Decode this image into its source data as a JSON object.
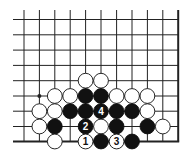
{
  "diagram": {
    "type": "go-board-fragment",
    "columns": 11,
    "rows": 9,
    "edges": [
      "right",
      "bottom"
    ],
    "colors": {
      "line": "#222222",
      "black_stone": "#111111",
      "white_stone": "#ffffff",
      "background": "#ffffff"
    },
    "star_points": [
      {
        "col": 1,
        "row": 5
      }
    ],
    "stones": [
      {
        "col": 4,
        "row": 4,
        "color": "white"
      },
      {
        "col": 5,
        "row": 4,
        "color": "white"
      },
      {
        "col": 2,
        "row": 5,
        "color": "white"
      },
      {
        "col": 3,
        "row": 5,
        "color": "white"
      },
      {
        "col": 4,
        "row": 5,
        "color": "black"
      },
      {
        "col": 5,
        "row": 5,
        "color": "black"
      },
      {
        "col": 6,
        "row": 5,
        "color": "white"
      },
      {
        "col": 7,
        "row": 5,
        "color": "white"
      },
      {
        "col": 8,
        "row": 5,
        "color": "white"
      },
      {
        "col": 1,
        "row": 6,
        "color": "white"
      },
      {
        "col": 2,
        "row": 6,
        "color": "white"
      },
      {
        "col": 3,
        "row": 6,
        "color": "black"
      },
      {
        "col": 4,
        "row": 6,
        "color": "black"
      },
      {
        "col": 5,
        "row": 6,
        "color": "black",
        "label": "4"
      },
      {
        "col": 6,
        "row": 6,
        "color": "black"
      },
      {
        "col": 7,
        "row": 6,
        "color": "black"
      },
      {
        "col": 8,
        "row": 6,
        "color": "white"
      },
      {
        "col": 1,
        "row": 7,
        "color": "white"
      },
      {
        "col": 2,
        "row": 7,
        "color": "black"
      },
      {
        "col": 4,
        "row": 7,
        "color": "black",
        "label": "2"
      },
      {
        "col": 5,
        "row": 7,
        "color": "white"
      },
      {
        "col": 6,
        "row": 7,
        "color": "black"
      },
      {
        "col": 8,
        "row": 7,
        "color": "black"
      },
      {
        "col": 9,
        "row": 7,
        "color": "white"
      },
      {
        "col": 2,
        "row": 8,
        "color": "white"
      },
      {
        "col": 4,
        "row": 8,
        "color": "white",
        "label": "1"
      },
      {
        "col": 5,
        "row": 8,
        "color": "black"
      },
      {
        "col": 6,
        "row": 8,
        "color": "white",
        "label": "3"
      },
      {
        "col": 7,
        "row": 8,
        "color": "black"
      }
    ]
  }
}
